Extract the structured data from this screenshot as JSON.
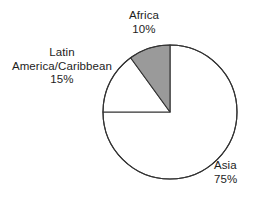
{
  "chart_data": {
    "type": "pie",
    "title": "",
    "subtitle": "",
    "xlabel": "",
    "ylabel": "",
    "legend_position": "none",
    "grid": false,
    "units": "percent",
    "start_angle_deg": 90,
    "direction": "counterclockwise",
    "categories": [
      "Africa",
      "Latin America/Caribbean",
      "Asia"
    ],
    "values": [
      10,
      15,
      75
    ],
    "slices": [
      {
        "name": "Africa",
        "label": "Africa",
        "value": 10,
        "value_text": "10%",
        "fill": "#9a9a9a",
        "stroke": "#333333",
        "start_deg": 90,
        "end_deg": 126,
        "sweep_deg": 36
      },
      {
        "name": "Latin America/Caribbean",
        "label_line1": "Latin",
        "label_line2": "America/Caribbean",
        "value": 15,
        "value_text": "15%",
        "fill": "#ffffff",
        "stroke": "#333333",
        "start_deg": 126,
        "end_deg": 180,
        "sweep_deg": 54
      },
      {
        "name": "Asia",
        "label": "Asia",
        "value": 75,
        "value_text": "75%",
        "fill": "#ffffff",
        "stroke": "#333333",
        "start_deg": 180,
        "end_deg": 450,
        "sweep_deg": 270
      }
    ],
    "geometry": {
      "center_x": 170,
      "center_y": 112,
      "radius": 67
    },
    "colors": {
      "background": "#ffffff",
      "outline": "#333333",
      "highlight_fill": "#9a9a9a",
      "plain_fill": "#ffffff",
      "text": "#1d1d1d"
    }
  }
}
